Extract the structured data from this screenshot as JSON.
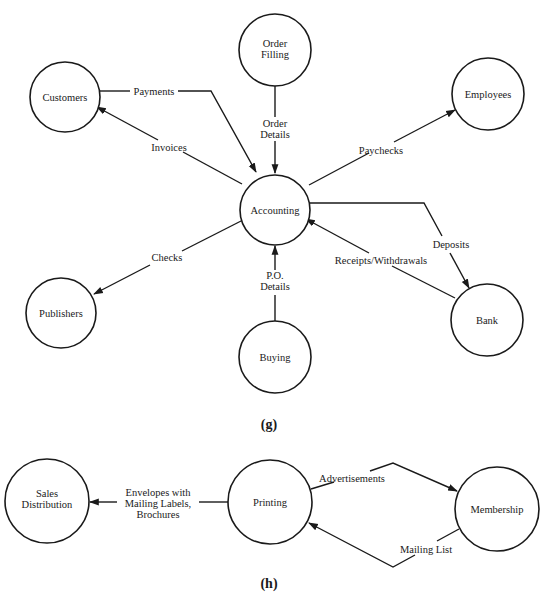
{
  "diagram_g": {
    "caption": "(g)",
    "nodes": {
      "accounting": "Accounting",
      "customers": "Customers",
      "order_filling_1": "Order",
      "order_filling_2": "Filling",
      "employees": "Employees",
      "publishers": "Publishers",
      "buying": "Buying",
      "bank": "Bank"
    },
    "flows": {
      "payments": "Payments",
      "invoices": "Invoices",
      "order_details_1": "Order",
      "order_details_2": "Details",
      "paychecks": "Paychecks",
      "checks": "Checks",
      "po_details_1": "P.O.",
      "po_details_2": "Details",
      "deposits": "Deposits",
      "receipts_withdrawals": "Receipts/Withdrawals"
    }
  },
  "diagram_h": {
    "caption": "(h)",
    "nodes": {
      "sales_distribution_1": "Sales",
      "sales_distribution_2": "Distribution",
      "printing": "Printing",
      "membership": "Membership"
    },
    "flows": {
      "envelopes_1": "Envelopes with",
      "envelopes_2": "Mailing Labels,",
      "envelopes_3": "Brochures",
      "advertisements": "Advertisements",
      "mailing_list": "Mailing List"
    }
  }
}
